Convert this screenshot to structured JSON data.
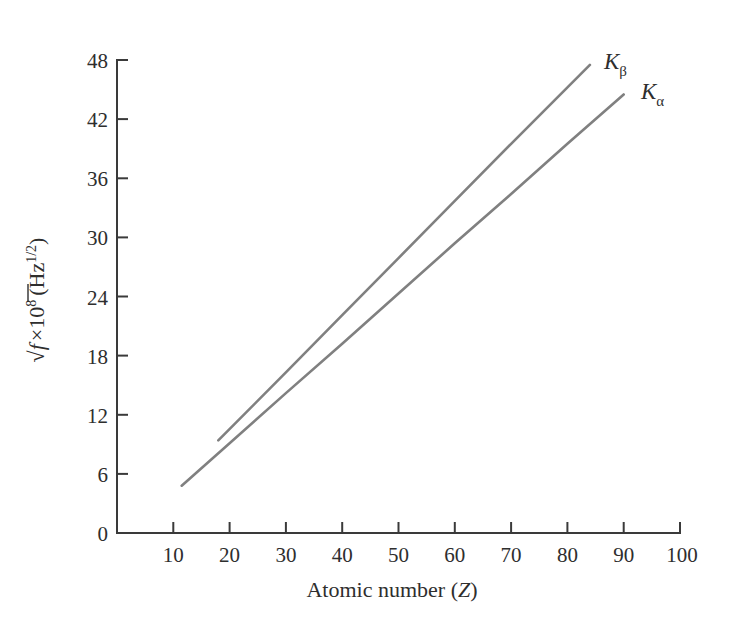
{
  "chart_data": {
    "type": "line",
    "title": "",
    "xlabel": "Atomic number (Z)",
    "ylabel_parts": {
      "radical": "√",
      "variable": "f",
      "times": "×",
      "base": "10",
      "exponent": "8",
      "unit_open": "(Hz",
      "unit_exponent": "1/2",
      "unit_close": ")"
    },
    "ylabel": "√f ×10⁸ (Hz¹ᐟ²)",
    "xlim": [
      0,
      100
    ],
    "ylim": [
      0,
      48
    ],
    "xticks": [
      10,
      20,
      30,
      40,
      50,
      60,
      70,
      80,
      90,
      100
    ],
    "yticks": [
      0,
      6,
      12,
      18,
      24,
      30,
      36,
      42,
      48
    ],
    "grid": false,
    "legend_position": "inline-end-of-line",
    "series": [
      {
        "name": "Kβ",
        "label_base": "K",
        "label_sub": "β",
        "color": "#808080",
        "x": [
          18,
          84
        ],
        "y": [
          9.4,
          47.5
        ],
        "points": [
          [
            18,
            9.4
          ],
          [
            30,
            16.3
          ],
          [
            40,
            22.1
          ],
          [
            50,
            27.9
          ],
          [
            60,
            33.7
          ],
          [
            70,
            39.5
          ],
          [
            84,
            47.5
          ]
        ]
      },
      {
        "name": "Kα",
        "label_base": "K",
        "label_sub": "α",
        "color": "#808080",
        "x": [
          11.5,
          90
        ],
        "y": [
          4.8,
          44.5
        ],
        "points": [
          [
            11.5,
            4.8
          ],
          [
            20,
            9.1
          ],
          [
            30,
            14.2
          ],
          [
            40,
            19.2
          ],
          [
            50,
            24.3
          ],
          [
            60,
            29.4
          ],
          [
            70,
            34.4
          ],
          [
            80,
            39.5
          ],
          [
            90,
            44.5
          ]
        ]
      }
    ],
    "axis_color": "#3a3a3a",
    "text_color": "#2e2e2e",
    "background": "#ffffff"
  },
  "xticklabels": [
    "10",
    "20",
    "30",
    "40",
    "50",
    "60",
    "70",
    "80",
    "90",
    "100"
  ],
  "yticklabels": [
    "0",
    "6",
    "12",
    "18",
    "24",
    "30",
    "36",
    "42",
    "48"
  ]
}
